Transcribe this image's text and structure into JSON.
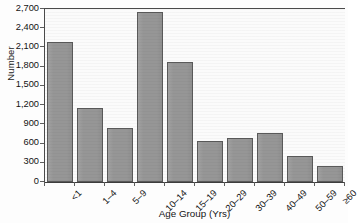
{
  "chart_data": {
    "type": "bar",
    "title": "",
    "xlabel": "Age Group (Yrs)",
    "ylabel": "Number",
    "categories": [
      "<1",
      "1–4",
      "5–9",
      "10–14",
      "15–19",
      "20–29",
      "30–39",
      "40–49",
      "50–59",
      "≥60"
    ],
    "values": [
      2190,
      1150,
      850,
      2650,
      1870,
      635,
      690,
      765,
      410,
      250
    ],
    "ylim": [
      0,
      2700
    ],
    "ytick_values": [
      0,
      300,
      600,
      900,
      1200,
      1500,
      1800,
      2100,
      2400,
      2700
    ],
    "ytick_labels": [
      "0",
      "300",
      "600",
      "900",
      "1,200",
      "1,500",
      "1,800",
      "2,100",
      "2,400",
      "2,700"
    ],
    "grid": false,
    "legend": null,
    "bar_color": "#969696",
    "bar_border_color": "#5a5a5a",
    "plot_background": "#fbfbfb",
    "axis_color": "#4a4a4a"
  }
}
